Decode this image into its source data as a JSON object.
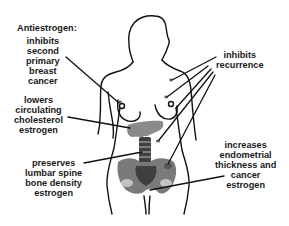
{
  "title": "Antiestrogen:",
  "labels": {
    "breast_cancer": [
      "inhibits",
      "second",
      "primary",
      "breast",
      "cancer"
    ],
    "recurrence": [
      "inhibits",
      "recurrence"
    ],
    "cholesterol": [
      "lowers",
      "circulating",
      "cholesterol",
      "estrogen"
    ],
    "bone": [
      "preserves",
      "lumbar spine",
      "bone density",
      "estrogen"
    ],
    "endometrium": [
      "increases",
      "endometrial",
      "thickness and",
      "cancer",
      "estrogen"
    ]
  },
  "colors": {
    "outline": "#111111",
    "organ_light": "#8a8a8a",
    "organ_mid": "#6f6f6f",
    "organ_dark": "#3f3f3f",
    "text": "#1a1a1a"
  }
}
